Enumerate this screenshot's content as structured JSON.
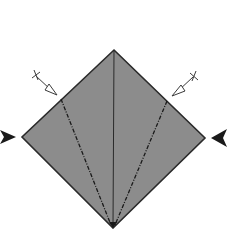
{
  "diagram": {
    "type": "origami-step",
    "colors": {
      "paper": "#8c8c8c",
      "line": "#2a2a2a",
      "background": "#ffffff"
    },
    "shape": {
      "top": [
        114,
        50
      ],
      "left": [
        22,
        137
      ],
      "right": [
        205,
        138
      ],
      "bottom": [
        113,
        228
      ]
    },
    "creases": [
      {
        "name": "center-line",
        "style": "solid",
        "from": [
          114,
          50
        ],
        "to": [
          113,
          228
        ]
      },
      {
        "name": "left-valley-fold",
        "style": "dash-dot",
        "from": [
          61,
          99
        ],
        "to": [
          111,
          226
        ]
      },
      {
        "name": "right-valley-fold",
        "style": "dash-dot",
        "from": [
          167,
          101
        ],
        "to": [
          115,
          226
        ]
      }
    ],
    "arrows": [
      {
        "name": "left-fold-arrow",
        "from": [
          35,
          75
        ],
        "to": [
          56,
          95
        ],
        "style": "hollow-head-with-cross-tail"
      },
      {
        "name": "right-fold-arrow",
        "from": [
          195,
          76
        ],
        "to": [
          173,
          96
        ],
        "style": "hollow-head-with-cross-tail"
      },
      {
        "name": "left-push-arrow",
        "at": [
          8,
          137
        ],
        "direction": "right",
        "style": "solid-black"
      },
      {
        "name": "right-push-arrow",
        "at": [
          220,
          138
        ],
        "direction": "left",
        "style": "solid-black"
      }
    ]
  }
}
